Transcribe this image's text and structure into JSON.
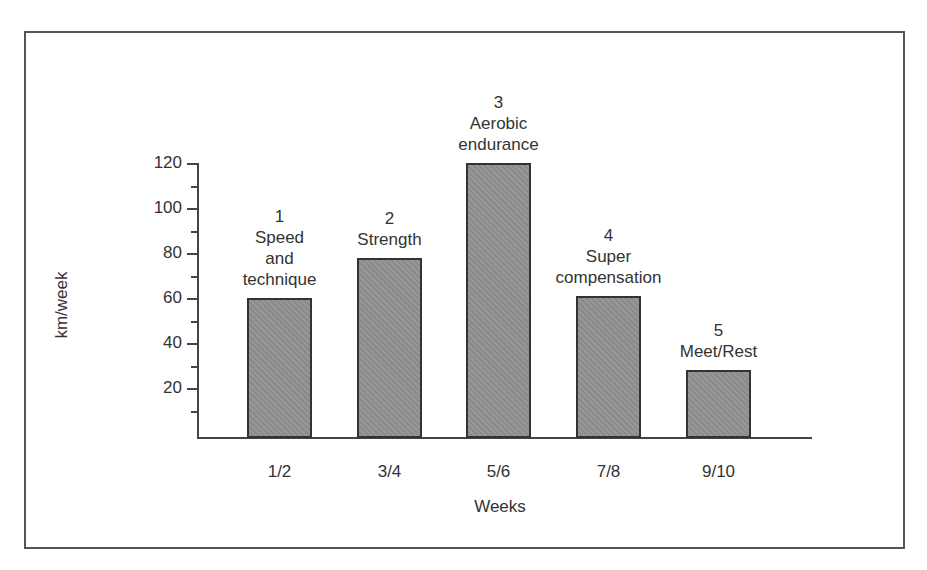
{
  "chart_data": {
    "type": "bar",
    "title": "",
    "xlabel": "Weeks",
    "ylabel": "km/week",
    "ylim": [
      0,
      120
    ],
    "yticks": [
      20,
      40,
      60,
      80,
      100,
      120
    ],
    "yticks_minor": [
      10,
      30,
      50,
      70,
      90,
      110
    ],
    "grid": false,
    "legend": null,
    "categories": [
      "1/2",
      "3/4",
      "5/6",
      "7/8",
      "9/10"
    ],
    "values": [
      60,
      78,
      120,
      61,
      28
    ],
    "annotations": [
      {
        "phase": "1",
        "text": "Speed\nand\ntechnique"
      },
      {
        "phase": "2",
        "text": "Strength"
      },
      {
        "phase": "3",
        "text": "Aerobic\nendurance"
      },
      {
        "phase": "4",
        "text": "Super\ncompensation"
      },
      {
        "phase": "5",
        "text": "Meet/Rest"
      }
    ],
    "bar_color": "#909090",
    "bar_edge_color": "#333333"
  },
  "labels": {
    "x_axis": "Weeks",
    "y_axis": "km/week",
    "yticks": [
      "20",
      "40",
      "60",
      "80",
      "100",
      "120"
    ],
    "bars": [
      {
        "category": "1/2",
        "label": "1\nSpeed\nand\ntechnique"
      },
      {
        "category": "3/4",
        "label": "2\nStrength"
      },
      {
        "category": "5/6",
        "label": "3\nAerobic\nendurance"
      },
      {
        "category": "7/8",
        "label": "4\nSuper\ncompensation"
      },
      {
        "category": "9/10",
        "label": "5\nMeet/Rest"
      }
    ]
  }
}
